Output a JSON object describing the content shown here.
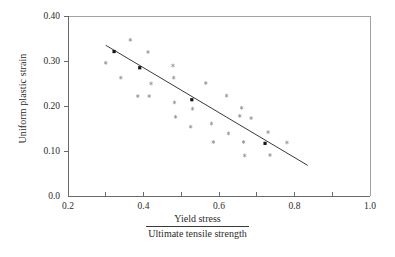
{
  "chart_data": {
    "type": "scatter",
    "title": "",
    "subtitle": "",
    "xlabel_numerator": "Yield stress",
    "xlabel_denominator": "Ultimate tensile strength",
    "ylabel": "Uniform plastic strain",
    "xlim": [
      0.2,
      1.0
    ],
    "ylim": [
      0.0,
      0.4
    ],
    "grid": false,
    "legend": "none",
    "x_ticks": [
      0.2,
      0.3,
      0.4,
      0.5,
      0.6,
      0.7,
      0.8,
      0.9,
      1.0
    ],
    "x_tick_labels": [
      "0.2",
      "",
      "0.4",
      "",
      "0.6",
      "",
      "0.8",
      "",
      "1.0"
    ],
    "y_ticks": [
      0.0,
      0.1,
      0.2,
      0.3,
      0.4
    ],
    "y_tick_labels": [
      "0.0",
      "0.10",
      "0.20",
      "0.30",
      "0.40"
    ],
    "series": [
      {
        "name": "data",
        "marker": "star",
        "color": "#9a9a9a",
        "points": [
          [
            0.3,
            0.296
          ],
          [
            0.34,
            0.263
          ],
          [
            0.365,
            0.347
          ],
          [
            0.385,
            0.222
          ],
          [
            0.412,
            0.32
          ],
          [
            0.415,
            0.222
          ],
          [
            0.42,
            0.25
          ],
          [
            0.478,
            0.29
          ],
          [
            0.48,
            0.263
          ],
          [
            0.482,
            0.208
          ],
          [
            0.485,
            0.176
          ],
          [
            0.525,
            0.154
          ],
          [
            0.53,
            0.194
          ],
          [
            0.565,
            0.251
          ],
          [
            0.58,
            0.161
          ],
          [
            0.585,
            0.12
          ],
          [
            0.62,
            0.223
          ],
          [
            0.625,
            0.139
          ],
          [
            0.655,
            0.178
          ],
          [
            0.66,
            0.196
          ],
          [
            0.665,
            0.12
          ],
          [
            0.668,
            0.09
          ],
          [
            0.685,
            0.173
          ],
          [
            0.73,
            0.142
          ],
          [
            0.735,
            0.091
          ],
          [
            0.78,
            0.119
          ]
        ]
      },
      {
        "name": "fit-markers",
        "marker": "square",
        "color": "#141414",
        "points": [
          [
            0.322,
            0.321
          ],
          [
            0.39,
            0.285
          ],
          [
            0.528,
            0.214
          ],
          [
            0.722,
            0.117
          ]
        ]
      }
    ],
    "trend_line": {
      "name": "linear fit",
      "color": "#3a3a3a",
      "x_start": 0.3,
      "y_start": 0.335,
      "x_end": 0.835,
      "y_end": 0.068
    }
  }
}
